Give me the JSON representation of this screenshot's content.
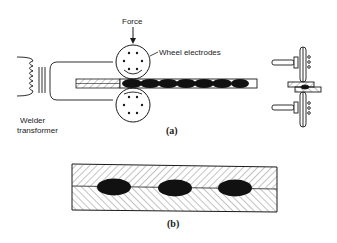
{
  "diagram": {
    "part_a": {
      "labels": {
        "force": "Force",
        "wheel_electrodes": "Wheel electrodes",
        "welder_transformer_line1": "Welder",
        "welder_transformer_line2": "transformer"
      },
      "caption": "(a)"
    },
    "part_b": {
      "caption": "(b)",
      "nugget_count": 3
    },
    "colors": {
      "ink": "#1a1a1a",
      "background": "#ffffff"
    }
  }
}
